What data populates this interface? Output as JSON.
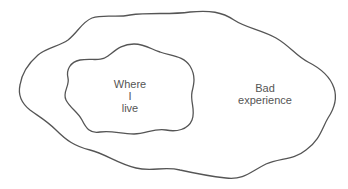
{
  "diagram": {
    "type": "nested-regions",
    "regions": [
      {
        "id": "outer",
        "label": "Bad\nexperience"
      },
      {
        "id": "inner",
        "label": "Where\nI\nlive"
      }
    ],
    "colors": {
      "stroke": "#555555",
      "text": "#555555",
      "background": "#ffffff"
    }
  }
}
